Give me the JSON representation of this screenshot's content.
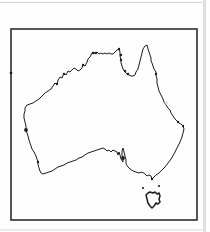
{
  "figure": {
    "region": "Australia",
    "colors": {
      "background": "#fefefe",
      "frame": "#2e2e2e",
      "coastline": "#1c1c1c",
      "artifact": "#d7d7d7",
      "smudge": "#c9c9c9"
    },
    "canvas": {
      "width": 210,
      "height": 232
    },
    "frame_box": {
      "x": 11,
      "y": 29,
      "width": 186,
      "height": 191
    },
    "map_data": {
      "mainland": [
        [
          25,
          108
        ],
        [
          27,
          105
        ],
        [
          30,
          104
        ],
        [
          33,
          103
        ],
        [
          36,
          101
        ],
        [
          39,
          99
        ],
        [
          42,
          96
        ],
        [
          45,
          93
        ],
        [
          48,
          91
        ],
        [
          51,
          89
        ],
        [
          53,
          86
        ],
        [
          55,
          83
        ],
        [
          57,
          85
        ],
        [
          58,
          80
        ],
        [
          60,
          77
        ],
        [
          62,
          78
        ],
        [
          64,
          73
        ],
        [
          66,
          75
        ],
        [
          68,
          71
        ],
        [
          70,
          72
        ],
        [
          72,
          70
        ],
        [
          74,
          68
        ],
        [
          76,
          69
        ],
        [
          78,
          71
        ],
        [
          80,
          70
        ],
        [
          82,
          68
        ],
        [
          83,
          65
        ],
        [
          85,
          66
        ],
        [
          87,
          62
        ],
        [
          88,
          59
        ],
        [
          90,
          57
        ],
        [
          92,
          53
        ],
        [
          94,
          52
        ],
        [
          95,
          54
        ],
        [
          97,
          52
        ],
        [
          99,
          54
        ],
        [
          101,
          53
        ],
        [
          103,
          54
        ],
        [
          105,
          53
        ],
        [
          107,
          54
        ],
        [
          109,
          53
        ],
        [
          111,
          54
        ],
        [
          113,
          54
        ],
        [
          115,
          52
        ],
        [
          117,
          50
        ],
        [
          119,
          49
        ],
        [
          120,
          52
        ],
        [
          120,
          56
        ],
        [
          121,
          60
        ],
        [
          121,
          63
        ],
        [
          122,
          66
        ],
        [
          123,
          69
        ],
        [
          125,
          72
        ],
        [
          127,
          74
        ],
        [
          129,
          75
        ],
        [
          131,
          76
        ],
        [
          133,
          76
        ],
        [
          135,
          75
        ],
        [
          136,
          72
        ],
        [
          138,
          69
        ],
        [
          139,
          65
        ],
        [
          140,
          61
        ],
        [
          141,
          57
        ],
        [
          142,
          53
        ],
        [
          143,
          49
        ],
        [
          145,
          46
        ],
        [
          147,
          45
        ],
        [
          148,
          49
        ],
        [
          149,
          52
        ],
        [
          150,
          55
        ],
        [
          151,
          58
        ],
        [
          151,
          61
        ],
        [
          152,
          63
        ],
        [
          153,
          66
        ],
        [
          154,
          69
        ],
        [
          156,
          72
        ],
        [
          156,
          75
        ],
        [
          157,
          79
        ],
        [
          157,
          83
        ],
        [
          158,
          87
        ],
        [
          159,
          91
        ],
        [
          161,
          95
        ],
        [
          163,
          99
        ],
        [
          164,
          102
        ],
        [
          166,
          105
        ],
        [
          168,
          108
        ],
        [
          170,
          110
        ],
        [
          171,
          113
        ],
        [
          173,
          116
        ],
        [
          175,
          119
        ],
        [
          177,
          121
        ],
        [
          179,
          123
        ],
        [
          181,
          124
        ],
        [
          183,
          126
        ],
        [
          184,
          129
        ],
        [
          183,
          133
        ],
        [
          182,
          137
        ],
        [
          180,
          142
        ],
        [
          178,
          146
        ],
        [
          176,
          150
        ],
        [
          174,
          154
        ],
        [
          171,
          159
        ],
        [
          168,
          163
        ],
        [
          165,
          167
        ],
        [
          162,
          170
        ],
        [
          159,
          173
        ],
        [
          156,
          175
        ],
        [
          154,
          177
        ],
        [
          152,
          179
        ],
        [
          151,
          176
        ],
        [
          149,
          175
        ],
        [
          147,
          176
        ],
        [
          145,
          174
        ],
        [
          142,
          172
        ],
        [
          139,
          173
        ],
        [
          136,
          172
        ],
        [
          133,
          171
        ],
        [
          130,
          169
        ],
        [
          128,
          167
        ],
        [
          126,
          164
        ],
        [
          126,
          160
        ],
        [
          125,
          156
        ],
        [
          124,
          152
        ],
        [
          123,
          148
        ],
        [
          122,
          151
        ],
        [
          122,
          155
        ],
        [
          123,
          159
        ],
        [
          123,
          162
        ],
        [
          121,
          159
        ],
        [
          120,
          155
        ],
        [
          119,
          152
        ],
        [
          118,
          155
        ],
        [
          117,
          152
        ],
        [
          115,
          151
        ],
        [
          113,
          150
        ],
        [
          111,
          152
        ],
        [
          109,
          150
        ],
        [
          107,
          151
        ],
        [
          105,
          149
        ],
        [
          103,
          148
        ],
        [
          100,
          149
        ],
        [
          97,
          150
        ],
        [
          94,
          151
        ],
        [
          91,
          152
        ],
        [
          88,
          153
        ],
        [
          85,
          155
        ],
        [
          82,
          157
        ],
        [
          79,
          158
        ],
        [
          76,
          160
        ],
        [
          73,
          161
        ],
        [
          70,
          162
        ],
        [
          67,
          163
        ],
        [
          64,
          165
        ],
        [
          61,
          166
        ],
        [
          58,
          167
        ],
        [
          55,
          169
        ],
        [
          52,
          171
        ],
        [
          49,
          172
        ],
        [
          46,
          173
        ],
        [
          43,
          174
        ],
        [
          41,
          173
        ],
        [
          40,
          171
        ],
        [
          39,
          168
        ],
        [
          38,
          165
        ],
        [
          38,
          162
        ],
        [
          37,
          159
        ],
        [
          36,
          156
        ],
        [
          34,
          152
        ],
        [
          32,
          149
        ],
        [
          31,
          146
        ],
        [
          30,
          143
        ],
        [
          29,
          140
        ],
        [
          28,
          136
        ],
        [
          27,
          133
        ],
        [
          26,
          130
        ],
        [
          26,
          126
        ],
        [
          25,
          122
        ],
        [
          24,
          118
        ],
        [
          24,
          114
        ],
        [
          25,
          111
        ]
      ],
      "tasmania": [
        [
          150,
          192
        ],
        [
          153,
          193
        ],
        [
          155,
          192
        ],
        [
          157,
          194
        ],
        [
          159,
          193
        ],
        [
          160,
          196
        ],
        [
          159,
          199
        ],
        [
          160,
          202
        ],
        [
          158,
          204
        ],
        [
          156,
          203
        ],
        [
          154,
          206
        ],
        [
          152,
          208
        ],
        [
          150,
          206
        ],
        [
          148,
          203
        ],
        [
          147,
          199
        ],
        [
          146,
          195
        ],
        [
          148,
          193
        ]
      ],
      "islands": [
        [
          143,
          188
        ],
        [
          159,
          186
        ]
      ],
      "knots": [
        [
          57,
          84
        ],
        [
          64,
          74
        ],
        [
          83,
          65
        ],
        [
          93,
          53
        ],
        [
          96,
          53
        ],
        [
          119,
          49
        ],
        [
          121,
          55
        ],
        [
          121,
          60
        ],
        [
          125,
          71
        ],
        [
          128,
          74
        ],
        [
          156,
          74
        ],
        [
          178,
          122
        ],
        [
          183,
          126
        ],
        [
          38,
          162
        ],
        [
          152,
          179
        ]
      ],
      "blobs": [
        [
          26,
          130
        ],
        [
          123,
          158
        ]
      ],
      "smudge": [
        166,
        103
      ],
      "border_speck": [
        11,
        73
      ]
    },
    "artifacts": {
      "top_line": {
        "x": 0,
        "y": 2,
        "width": 202,
        "height": 1
      },
      "right_band": {
        "x": 203,
        "y": 0,
        "width": 3,
        "height": 232
      },
      "bottom_line": {
        "x": 0,
        "y": 229.5,
        "width": 202,
        "height": 1
      }
    }
  }
}
